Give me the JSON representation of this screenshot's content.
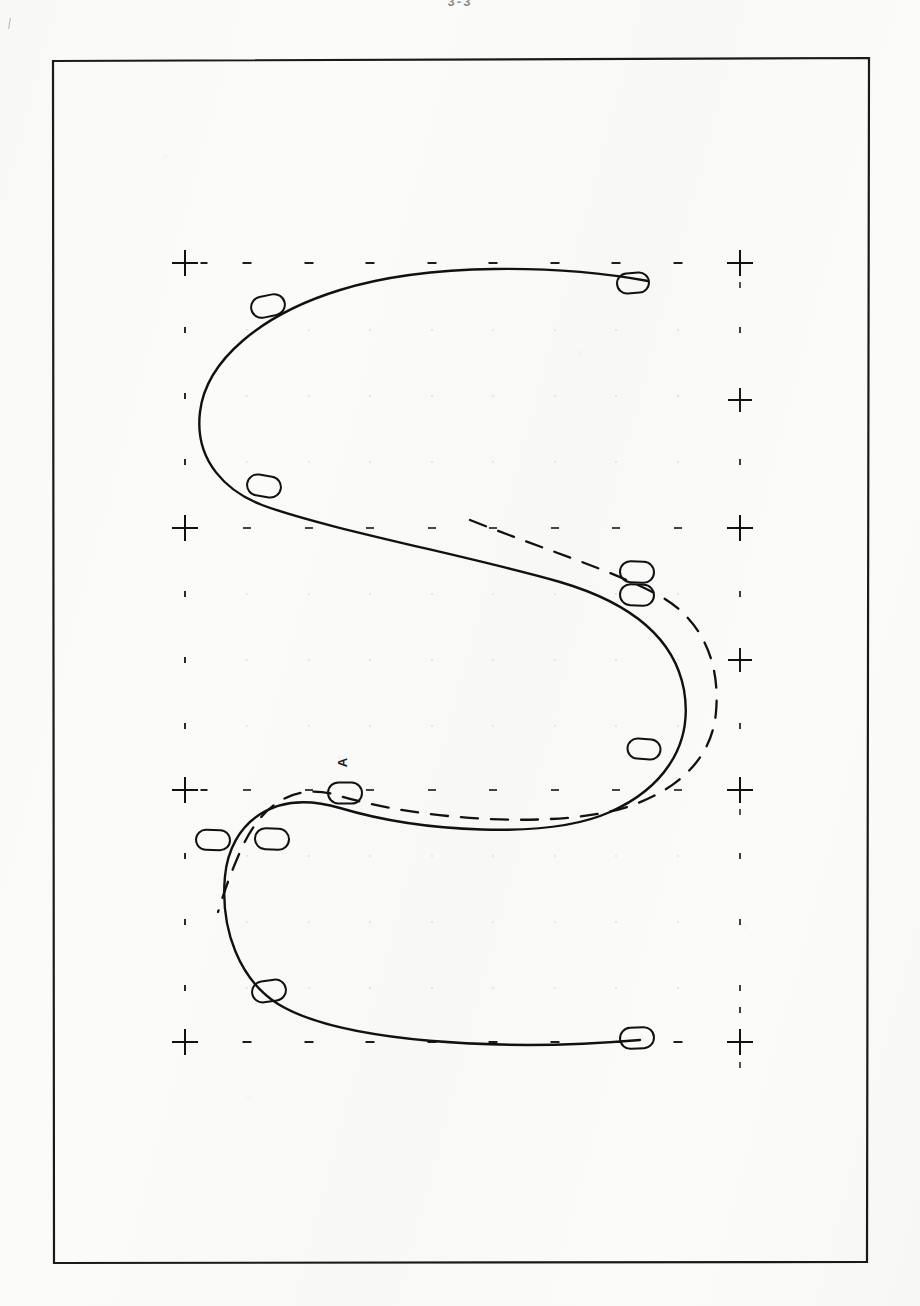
{
  "page": {
    "background_color": "#fbfbfa",
    "ink_color": "#111111",
    "caption": "3-3",
    "edge_mark_name": "page-edge-mark"
  },
  "frame": {
    "x": 53,
    "y": 60,
    "width": 815,
    "height": 1202,
    "stroke": "#1a1a1a",
    "stroke_width": 2.2
  },
  "chart_data": {
    "type": "line",
    "title": "3-3",
    "xlabel": "",
    "ylabel": "",
    "orientation": "rotated-90",
    "grid": "sparse tick marks, major crosses at grid intersections, minor dashes between",
    "legend": "none",
    "annotations": [
      {
        "text": "A",
        "x": 346,
        "y": 764,
        "rotation": -90
      }
    ],
    "axis": {
      "major_x_px": [
        185,
        740
      ],
      "major_y_px": [
        263,
        528,
        790,
        1042
      ],
      "minor_x_px": [
        247,
        309,
        370,
        432,
        493,
        555,
        616,
        678
      ],
      "minor_y_px": [
        330,
        396,
        462,
        594,
        660,
        726,
        856,
        922,
        988
      ],
      "right_extra_major_y_px": [
        400,
        660
      ]
    },
    "series": [
      {
        "name": "solid-curve",
        "style": "solid",
        "stroke": "#111111",
        "stroke_width": 2.4,
        "path": "M 648 281 C 560 265, 430 262, 340 290 C 262 314, 206 360, 200 412 C 194 462, 228 492, 262 505 C 330 530, 470 556, 560 582 C 628 602, 674 636, 684 690 C 694 748, 660 790, 610 812 C 548 840, 420 832, 340 808 C 272 788, 230 824, 225 876 C 220 930, 240 980, 278 1004 C 340 1042, 500 1052, 640 1040"
      },
      {
        "name": "dashed-curve",
        "style": "dashed",
        "stroke": "#111111",
        "stroke_width": 2.3,
        "dasharray": "17 13",
        "path": "M 470 520 C 540 548, 612 570, 660 596 C 706 622, 720 668, 716 712 C 712 760, 676 790, 630 806 C 560 830, 420 820, 340 796 C 290 780, 258 810, 240 852 C 226 884, 222 900, 218 912"
      }
    ],
    "markers": [
      {
        "name": "marker-1",
        "x": 633,
        "y": 283,
        "w": 32,
        "h": 20,
        "rot": -4
      },
      {
        "name": "marker-2",
        "x": 268,
        "y": 306,
        "w": 34,
        "h": 21,
        "rot": -12
      },
      {
        "name": "marker-3",
        "x": 264,
        "y": 486,
        "w": 34,
        "h": 21,
        "rot": 9
      },
      {
        "name": "marker-4",
        "x": 637,
        "y": 572,
        "w": 34,
        "h": 21,
        "rot": 2
      },
      {
        "name": "marker-5",
        "x": 637,
        "y": 595,
        "w": 34,
        "h": 21,
        "rot": 2
      },
      {
        "name": "marker-6",
        "x": 644,
        "y": 749,
        "w": 33,
        "h": 20,
        "rot": 4
      },
      {
        "name": "marker-7",
        "x": 345,
        "y": 793,
        "w": 34,
        "h": 21,
        "rot": 1
      },
      {
        "name": "marker-8",
        "x": 213,
        "y": 840,
        "w": 34,
        "h": 20,
        "rot": 2
      },
      {
        "name": "marker-9",
        "x": 272,
        "y": 839,
        "w": 34,
        "h": 21,
        "rot": 2
      },
      {
        "name": "marker-10",
        "x": 269,
        "y": 991,
        "w": 34,
        "h": 21,
        "rot": -8
      },
      {
        "name": "marker-11",
        "x": 637,
        "y": 1038,
        "w": 34,
        "h": 21,
        "rot": -3
      }
    ]
  }
}
